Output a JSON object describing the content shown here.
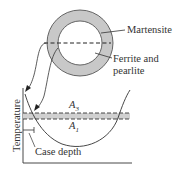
{
  "diagram": {
    "ring_labels": {
      "outer": "Martensite",
      "inner_line1": "Ferrite and",
      "inner_line2": "pearlite"
    },
    "plot": {
      "ylabel": "Temperature",
      "a3_label": "A",
      "a3_sub": "3",
      "a1_label": "A",
      "a1_sub": "1",
      "case_depth_label": "Case depth"
    },
    "colors": {
      "ring_fill": "#c8c8c8",
      "band_fill": "#d0d0d0",
      "line": "#333333",
      "text": "#333333"
    }
  }
}
